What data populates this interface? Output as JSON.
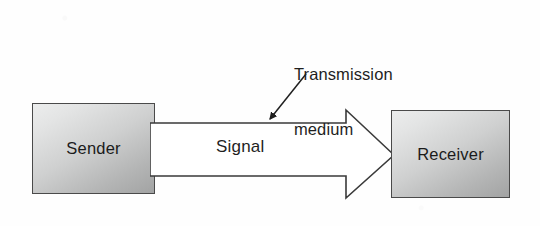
{
  "diagram": {
    "background_color": "#fefefe",
    "nodes": [
      {
        "id": "sender",
        "label": "Sender",
        "shape": "rectangle",
        "fill": "gray-gradient",
        "border_color": "#4a4a4a"
      },
      {
        "id": "receiver",
        "label": "Receiver",
        "shape": "rectangle",
        "fill": "gray-gradient",
        "border_color": "#4a4a4a"
      }
    ],
    "connector": {
      "id": "transmission-arrow",
      "kind": "block-arrow",
      "direction": "left-to-right",
      "from": "sender",
      "to": "receiver",
      "fill": "#ffffff",
      "stroke": "#3a3a3a",
      "inner_label": "Signal"
    },
    "annotation": {
      "id": "transmission-medium-callout",
      "text_line1": "Transmission",
      "text_line2": "medium",
      "pointer": "arrow pointing down-left to the transmission arrow",
      "stroke": "#1f1f1f"
    }
  }
}
